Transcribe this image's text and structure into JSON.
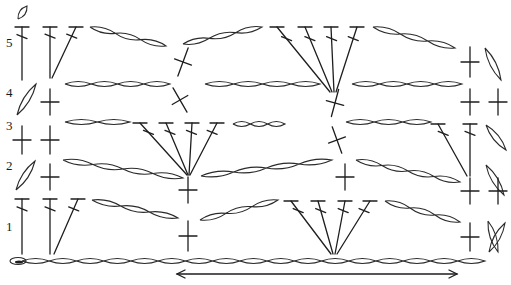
{
  "diagram": {
    "stroke_color": "#1e1e1e",
    "background": "#ffffff",
    "row_labels": [
      {
        "text": "5",
        "x": 6,
        "y": 42
      },
      {
        "text": "4",
        "x": 6,
        "y": 92
      },
      {
        "text": "3",
        "x": 6,
        "y": 125
      },
      {
        "text": "2",
        "x": 6,
        "y": 165
      },
      {
        "text": "1",
        "x": 6,
        "y": 226
      }
    ],
    "direction_arrow": {
      "x1": 177,
      "x2": 457,
      "y": 274,
      "type": "double-headed"
    },
    "foundation_chain": {
      "x_start": 10,
      "x_end": 485,
      "y": 261,
      "count": 17
    },
    "chains": [
      {
        "row": 5,
        "x1": 90,
        "y1": 27,
        "x2": 166,
        "y2": 46,
        "count": 3
      },
      {
        "row": 5,
        "x1": 183,
        "y1": 44,
        "x2": 262,
        "y2": 27,
        "count": 3
      },
      {
        "row": 5,
        "x1": 373,
        "y1": 27,
        "x2": 455,
        "y2": 48,
        "count": 3
      },
      {
        "row": 4,
        "x1": 65,
        "y1": 84,
        "x2": 170,
        "y2": 84,
        "count": 4
      },
      {
        "row": 4,
        "x1": 205,
        "y1": 84,
        "x2": 320,
        "y2": 84,
        "count": 4
      },
      {
        "row": 4,
        "x1": 352,
        "y1": 84,
        "x2": 462,
        "y2": 84,
        "count": 4
      },
      {
        "row": 3,
        "x1": 65,
        "y1": 122,
        "x2": 130,
        "y2": 122,
        "count": 2
      },
      {
        "row": 3,
        "x1": 233,
        "y1": 124,
        "x2": 285,
        "y2": 124,
        "count": 3
      },
      {
        "row": 3,
        "x1": 346,
        "y1": 122,
        "x2": 431,
        "y2": 122,
        "count": 3
      },
      {
        "row": 2,
        "x1": 63,
        "y1": 160,
        "x2": 183,
        "y2": 178,
        "count": 4
      },
      {
        "row": 2,
        "x1": 201,
        "y1": 176,
        "x2": 332,
        "y2": 160,
        "count": 4
      },
      {
        "row": 2,
        "x1": 356,
        "y1": 160,
        "x2": 460,
        "y2": 182,
        "count": 4
      },
      {
        "row": 1,
        "x1": 92,
        "y1": 200,
        "x2": 178,
        "y2": 218,
        "count": 3
      },
      {
        "row": 1,
        "x1": 200,
        "y1": 220,
        "x2": 278,
        "y2": 200,
        "count": 3
      },
      {
        "row": 1,
        "x1": 385,
        "y1": 201,
        "x2": 460,
        "y2": 222,
        "count": 3
      }
    ],
    "turning_chains": [
      {
        "x1": 18,
        "y1": 19,
        "x2": 27,
        "y2": 6
      },
      {
        "x1": 17,
        "y1": 115,
        "x2": 36,
        "y2": 84
      },
      {
        "x1": 16,
        "y1": 190,
        "x2": 35,
        "y2": 161
      },
      {
        "x1": 485,
        "y1": 48,
        "x2": 501,
        "y2": 80
      },
      {
        "x1": 486,
        "y1": 125,
        "x2": 506,
        "y2": 150
      },
      {
        "x1": 486,
        "y1": 165,
        "x2": 504,
        "y2": 195
      },
      {
        "x1": 488,
        "y1": 221,
        "x2": 498,
        "y2": 252
      },
      {
        "x1": 489,
        "y1": 252,
        "x2": 505,
        "y2": 223
      }
    ],
    "double_crochets": [
      {
        "row": 5,
        "x1": 22,
        "y1": 27,
        "x2": 22,
        "y2": 80
      },
      {
        "row": 5,
        "x1": 50,
        "y1": 27,
        "x2": 50,
        "y2": 78
      },
      {
        "row": 5,
        "x1": 76,
        "y1": 27,
        "x2": 52,
        "y2": 78
      },
      {
        "row": 5,
        "x1": 277,
        "y1": 27,
        "x2": 330,
        "y2": 92
      },
      {
        "row": 5,
        "x1": 305,
        "y1": 27,
        "x2": 332,
        "y2": 92
      },
      {
        "row": 5,
        "x1": 331,
        "y1": 27,
        "x2": 334,
        "y2": 92
      },
      {
        "row": 5,
        "x1": 357,
        "y1": 27,
        "x2": 336,
        "y2": 92
      },
      {
        "row": 3,
        "x1": 140,
        "y1": 123,
        "x2": 187,
        "y2": 175
      },
      {
        "row": 3,
        "x1": 166,
        "y1": 123,
        "x2": 188,
        "y2": 175
      },
      {
        "row": 3,
        "x1": 192,
        "y1": 123,
        "x2": 189,
        "y2": 175
      },
      {
        "row": 3,
        "x1": 217,
        "y1": 123,
        "x2": 190,
        "y2": 175
      },
      {
        "row": 3,
        "x1": 438,
        "y1": 124,
        "x2": 467,
        "y2": 176
      },
      {
        "row": 3,
        "x1": 470,
        "y1": 124,
        "x2": 470,
        "y2": 176
      },
      {
        "row": 1,
        "x1": 22,
        "y1": 199,
        "x2": 22,
        "y2": 254
      },
      {
        "row": 1,
        "x1": 50,
        "y1": 199,
        "x2": 50,
        "y2": 254
      },
      {
        "row": 1,
        "x1": 78,
        "y1": 199,
        "x2": 54,
        "y2": 254
      },
      {
        "row": 1,
        "x1": 291,
        "y1": 201,
        "x2": 331,
        "y2": 254
      },
      {
        "row": 1,
        "x1": 318,
        "y1": 201,
        "x2": 333,
        "y2": 254
      },
      {
        "row": 1,
        "x1": 345,
        "y1": 201,
        "x2": 335,
        "y2": 254
      },
      {
        "row": 1,
        "x1": 370,
        "y1": 201,
        "x2": 337,
        "y2": 254
      }
    ],
    "single_crochets": [
      {
        "row": 4,
        "x": 50,
        "y": 102,
        "len": 26,
        "angle": 0
      },
      {
        "row": 3,
        "x": 22,
        "y": 140,
        "len": 28,
        "angle": 0
      },
      {
        "row": 3,
        "x": 50,
        "y": 140,
        "len": 28,
        "angle": 0
      },
      {
        "row": 2,
        "x": 50,
        "y": 177,
        "len": 26,
        "angle": 0
      },
      {
        "row": 2,
        "x": 188,
        "y": 190,
        "len": 26,
        "angle": 0
      },
      {
        "row": 1,
        "x": 188,
        "y": 236,
        "len": 30,
        "angle": 0
      },
      {
        "row": 5,
        "x": 470,
        "y": 62,
        "len": 30,
        "angle": 0
      },
      {
        "row": 4,
        "x": 470,
        "y": 102,
        "len": 26,
        "angle": 0
      },
      {
        "row": 4,
        "x": 498,
        "y": 102,
        "len": 26,
        "angle": 0
      },
      {
        "row": 2,
        "x": 470,
        "y": 191,
        "len": 26,
        "angle": 0
      },
      {
        "row": 2,
        "x": 498,
        "y": 191,
        "len": 26,
        "angle": 0
      },
      {
        "row": 1,
        "x": 470,
        "y": 237,
        "len": 28,
        "angle": 0
      },
      {
        "row": 5,
        "x": 183,
        "y": 62,
        "len": 30,
        "angle": 20
      },
      {
        "row": 4,
        "x": 180,
        "y": 100,
        "len": 28,
        "angle": -30
      },
      {
        "row": 4,
        "x": 335,
        "y": 103,
        "len": 28,
        "angle": 15
      },
      {
        "row": 3,
        "x": 337,
        "y": 140,
        "len": 28,
        "angle": -20
      },
      {
        "row": 2,
        "x": 345,
        "y": 177,
        "len": 26,
        "angle": 0
      }
    ]
  }
}
